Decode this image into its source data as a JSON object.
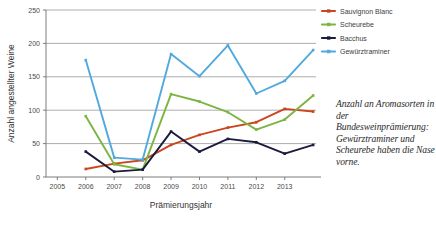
{
  "chart_data": {
    "type": "line",
    "title": "",
    "xlabel": "Prämierungsjahr",
    "ylabel": "Anzahl angestellter Weine",
    "x": [
      2006,
      2007,
      2008,
      2009,
      2010,
      2011,
      2012,
      2013,
      2014
    ],
    "xticklabels": [
      "2005",
      "2006",
      "2007",
      "2008",
      "2009",
      "2010",
      "2011",
      "2012",
      "2013"
    ],
    "xticks": [
      2005,
      2006,
      2007,
      2008,
      2009,
      2010,
      2011,
      2012,
      2013
    ],
    "yticklabels": [
      "0",
      "50",
      "100",
      "150",
      "200",
      "250"
    ],
    "yticks": [
      0,
      50,
      100,
      150,
      200,
      250
    ],
    "ylim": [
      0,
      250
    ],
    "xlim": [
      2004.6,
      2014.1
    ],
    "grid": "horizontal",
    "legend_position": "top-right",
    "series": [
      {
        "name": "Sauvignon Blanc",
        "color": "#C8471F",
        "values": [
          12,
          20,
          25,
          48,
          63,
          74,
          82,
          102,
          98
        ]
      },
      {
        "name": "Scheurebe",
        "color": "#7DB542",
        "values": [
          91,
          19,
          11,
          124,
          113,
          97,
          71,
          86,
          122
        ]
      },
      {
        "name": "Bacchus",
        "color": "#1B1B3F",
        "values": [
          38,
          8,
          11,
          68,
          38,
          57,
          52,
          35,
          48
        ]
      },
      {
        "name": "Gewürztraminer",
        "color": "#51A9DE",
        "values": [
          175,
          29,
          26,
          184,
          151,
          197,
          125,
          144,
          190
        ]
      }
    ]
  },
  "caption": {
    "text": "Anzahl an Aromasorten in der Bundesweinprämierung: Gewürztraminer und Scheurebe haben die Nase vorne."
  }
}
